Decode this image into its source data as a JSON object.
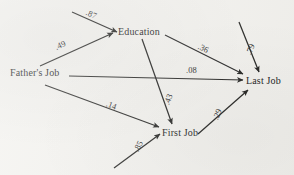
{
  "diagram": {
    "background_color": "#f2f1ed",
    "line_color": "#1d1d1b",
    "nodes": [
      {
        "id": "fathers_job",
        "label": "Father's Job",
        "x": 10,
        "y": 68
      },
      {
        "id": "education",
        "label": "Education",
        "x": 118,
        "y": 27
      },
      {
        "id": "first_job",
        "label": "First Job",
        "x": 162,
        "y": 128
      },
      {
        "id": "last_job",
        "label": "Last Job",
        "x": 246,
        "y": 76
      }
    ],
    "edges": [
      {
        "id": "e-residual-education",
        "from": "residual",
        "to": "education",
        "coefficient": ".87",
        "label_x": 86,
        "label_y": 10
      },
      {
        "id": "e-father-education",
        "from": "fathers_job",
        "to": "education",
        "coefficient": ".49",
        "label_x": 55,
        "label_y": 41
      },
      {
        "id": "e-education-last",
        "from": "education",
        "to": "last_job",
        "coefficient": ".36",
        "label_x": 198,
        "label_y": 44
      },
      {
        "id": "e-residual-last",
        "from": "residual",
        "to": "last_job",
        "coefficient": ".79",
        "label_x": 245,
        "label_y": 45
      },
      {
        "id": "e-father-last",
        "from": "fathers_job",
        "to": "last_job",
        "coefficient": ".08",
        "label_x": 186,
        "label_y": 66
      },
      {
        "id": "e-education-first",
        "from": "education",
        "to": "first_job",
        "coefficient": ".43",
        "label_x": 163,
        "label_y": 95
      },
      {
        "id": "e-father-first",
        "from": "fathers_job",
        "to": "first_job",
        "coefficient": ".14",
        "label_x": 106,
        "label_y": 101
      },
      {
        "id": "e-first-last",
        "from": "first_job",
        "to": "last_job",
        "coefficient": ".29",
        "label_x": 212,
        "label_y": 110
      },
      {
        "id": "e-residual-first",
        "from": "residual",
        "to": "first_job",
        "coefficient": ".85",
        "label_x": 133,
        "label_y": 142
      }
    ]
  }
}
